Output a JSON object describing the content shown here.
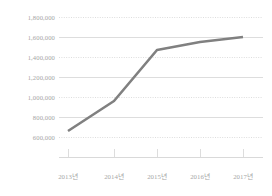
{
  "chart_data": {
    "type": "line",
    "title": "",
    "subtitle": "",
    "xlabel": "",
    "ylabel": "",
    "categories": [
      "2013년",
      "2014년",
      "2015년",
      "2016년",
      "2017년"
    ],
    "series": [
      {
        "name": "",
        "values": [
          670000,
          925000,
          1470000,
          1555000,
          1600000
        ],
        "color": "#808080"
      }
    ],
    "ylim": [
      500000,
      1800000
    ],
    "y_ticks": [
      1800000,
      1600000,
      1400000,
      1200000,
      1000000,
      800000,
      600000
    ],
    "y_tick_labels": [
      "1,800,000",
      "1,600,000",
      "1,400,000",
      "1,200,000",
      "1,000,000",
      "800,000",
      "600,000"
    ],
    "x_tick_labels": [
      "2013년",
      "2014년",
      "2015년",
      "2016년",
      "2017년"
    ],
    "grid": {
      "horizontal": true,
      "vertical": false,
      "styles": [
        "dotted",
        "solid",
        "dotted",
        "solid",
        "dotted",
        "solid",
        "dotted"
      ],
      "solid_color": "#d9d9d9",
      "dotted_color": "#d9d9d9"
    },
    "legend": {
      "visible": false,
      "position": "none",
      "entries": []
    },
    "axis": {
      "x_axis_line_color": "#d9d9d9",
      "tick_marks": true,
      "tick_direction": "up",
      "label_color": "#a6a6a6"
    },
    "annotations": [],
    "markers": false
  },
  "geometry": {
    "plot_left": 59,
    "plot_right": 263,
    "plot_top": 17,
    "plot_bottom": 157,
    "y_positions": [
      17,
      37,
      57,
      77,
      97,
      117,
      137
    ],
    "x_positions": [
      68,
      114,
      157,
      200,
      243
    ],
    "point_y": [
      131,
      101,
      50,
      42,
      37
    ]
  }
}
